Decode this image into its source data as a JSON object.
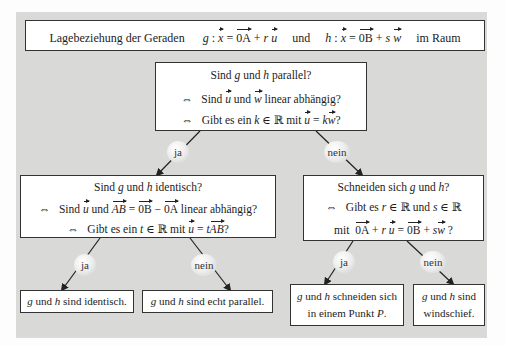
{
  "title": {
    "text": "Lagebeziehung der Geraden",
    "line_g": {
      "name": "g",
      "point": "0A",
      "param": "r",
      "dir": "u"
    },
    "connector": "und",
    "line_h": {
      "name": "h",
      "point": "0B",
      "param": "s",
      "dir": "w"
    },
    "suffix": "im Raum"
  },
  "q_parallel": {
    "line1": {
      "pre": "Sind",
      "a": "g",
      "mid": "und",
      "b": "h",
      "post": "parallel?"
    },
    "line2": {
      "equiv": "⇔",
      "pre": "Sind",
      "v1": "u",
      "mid": "und",
      "v2": "w",
      "post": "linear abhängig?"
    },
    "line3": {
      "equiv": "⇔",
      "pre": "Gibt es ein",
      "k": "k",
      "in": "∈ ℝ mit",
      "v1": "u",
      "eq": "=",
      "k2": "k",
      "v2": "w",
      "post": "?"
    }
  },
  "q_identisch": {
    "line1": {
      "pre": "Sind",
      "a": "g",
      "mid": "und",
      "b": "h",
      "post": "identisch?"
    },
    "line2": {
      "equiv": "⇔",
      "pre": "Sind",
      "v1": "u",
      "mid": "und",
      "ab": "AB",
      "eq": "=",
      "ob": "0B",
      "minus": "−",
      "oa": "0A",
      "post": "linear abhängig?"
    },
    "line3": {
      "equiv": "⇔",
      "pre": "Gibt es ein",
      "t": "t",
      "in": "∈ ℝ mit",
      "v1": "u",
      "eq": "=",
      "t2": "t",
      "ab": "AB",
      "post": "?"
    }
  },
  "q_schneiden": {
    "line1": {
      "pre": "Schneiden sich",
      "a": "g",
      "mid": "und",
      "b": "h",
      "post": "?"
    },
    "line2": {
      "equiv": "⇔",
      "pre": "Gibt es",
      "r": "r",
      "in1": "∈ ℝ und",
      "s": "s",
      "in2": "∈ ℝ"
    },
    "line3": {
      "pre": "mit",
      "oa": "0A",
      "plus1": "+",
      "r": "r",
      "u": "u",
      "eq": "=",
      "ob": "0B",
      "plus2": "+",
      "s": "s",
      "w": "w",
      "post": "?"
    }
  },
  "edges": {
    "yes": "ja",
    "no": "nein"
  },
  "results": {
    "identisch": {
      "a": "g",
      "mid": "und",
      "b": "h",
      "post": "sind identisch."
    },
    "echt_parallel": {
      "a": "g",
      "mid": "und",
      "b": "h",
      "post": "sind echt parallel."
    },
    "schneiden": {
      "a": "g",
      "mid": "und",
      "b": "h",
      "post": "schneiden sich",
      "line2": "in einem Punkt",
      "p": "P",
      "dot": "."
    },
    "windschief": {
      "a": "g",
      "mid": "und",
      "b": "h",
      "post": "sind",
      "line2": "windschief."
    }
  },
  "colors": {
    "panel": "#d9d9d7",
    "box_fill": "#ffffff",
    "border": "#333333",
    "arrow": "#222222"
  }
}
